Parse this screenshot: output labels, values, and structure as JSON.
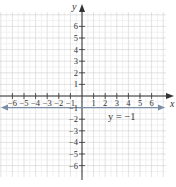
{
  "chart_data": {
    "type": "line",
    "title": "",
    "xlabel": "x",
    "ylabel": "y",
    "xlim": [
      -7,
      7
    ],
    "ylim": [
      -7,
      7
    ],
    "grid": true,
    "x_ticks": [
      -6,
      -5,
      -4,
      -3,
      -2,
      -1,
      1,
      2,
      3,
      4,
      5,
      6
    ],
    "x_tick_labels": [
      "−6",
      "−5",
      "−4",
      "−3",
      "−2",
      "−1",
      "1",
      "2",
      "3",
      "4",
      "5",
      "6"
    ],
    "y_ticks": [
      6,
      5,
      4,
      3,
      2,
      1,
      -1,
      -2,
      -3,
      -4,
      -5,
      -6
    ],
    "y_tick_labels": [
      "6",
      "5",
      "4",
      "3",
      "2",
      "1",
      "−1",
      "−2",
      "−3",
      "−4",
      "−5",
      "−6"
    ],
    "series": [
      {
        "name": "y = −1",
        "equation": "y = -1",
        "x": [
          -7,
          7
        ],
        "y": [
          -1,
          -1
        ],
        "color": "#7a8fa6",
        "arrows_both_ends": true
      }
    ],
    "annotations": [
      {
        "text": "y = −1",
        "x": 2.5,
        "y": -1.6
      }
    ]
  },
  "labels": {
    "x_axis": "x",
    "y_axis": "y",
    "line_label": "y = −1"
  }
}
